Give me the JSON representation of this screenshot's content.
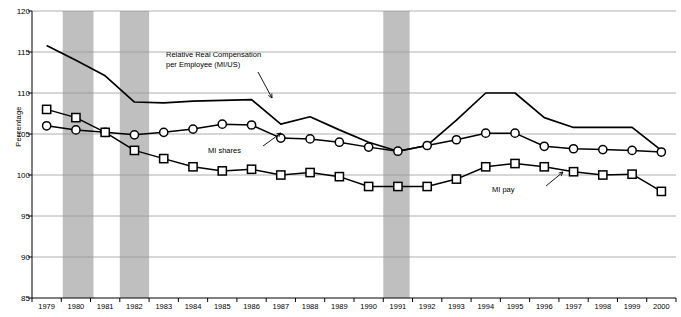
{
  "chart_data": {
    "type": "line",
    "title": "",
    "xlabel": "",
    "ylabel": "Percentage",
    "ylim": [
      85,
      120
    ],
    "ytick_step": 5,
    "yticks": [
      85,
      90,
      95,
      100,
      105,
      110,
      115,
      120
    ],
    "grid": true,
    "legend": "none-annotations-inline",
    "x": [
      1979,
      1980,
      1981,
      1982,
      1983,
      1984,
      1985,
      1986,
      1987,
      1988,
      1989,
      1990,
      1991,
      1992,
      1993,
      1994,
      1995,
      1996,
      1997,
      1998,
      1999,
      2000
    ],
    "categories": [
      "1979",
      "1980",
      "1981",
      "1982",
      "1983",
      "1984",
      "1985",
      "1986",
      "1987",
      "1988",
      "1989",
      "1990",
      "1991",
      "1992",
      "1993",
      "1994",
      "1995",
      "1996",
      "1997",
      "1998",
      "1999",
      "2000"
    ],
    "series": [
      {
        "name": "Relative Real Compensation per Employee (MI/US)",
        "marker": "none",
        "values": [
          115.8,
          114.0,
          112.1,
          108.9,
          108.8,
          109.0,
          109.1,
          109.2,
          106.2,
          107.1,
          105.5,
          104.0,
          102.9,
          103.6,
          106.7,
          110.0,
          110.0,
          107.0,
          105.8,
          105.8,
          105.8,
          103.0
        ]
      },
      {
        "name": "MI shares",
        "marker": "circle",
        "values": [
          106.0,
          105.5,
          105.2,
          104.9,
          105.2,
          105.6,
          106.2,
          106.1,
          104.5,
          104.4,
          104.0,
          103.4,
          102.9,
          103.6,
          104.3,
          105.1,
          105.1,
          103.5,
          103.2,
          103.1,
          103.0,
          102.8
        ]
      },
      {
        "name": "MI pay",
        "marker": "square",
        "values": [
          108.0,
          107.0,
          105.2,
          103.0,
          102.0,
          101.0,
          100.5,
          100.7,
          100.0,
          100.3,
          99.8,
          98.6,
          98.6,
          98.6,
          99.5,
          101.0,
          101.4,
          101.0,
          100.4,
          100.0,
          100.1,
          98.0
        ]
      }
    ],
    "annotations": [
      {
        "name": "compensation-label",
        "text": "Relative Real Compensation\nper Employee (MI/US)"
      },
      {
        "name": "mi-shares-label",
        "text": "MI shares"
      },
      {
        "name": "mi-pay-label",
        "text": "MI pay"
      }
    ],
    "shaded_bands": [
      {
        "name": "recession-band-1",
        "from": 1979.55,
        "to": 1980.6
      },
      {
        "name": "recession-band-2",
        "from": 1981.5,
        "to": 1982.5
      },
      {
        "name": "recession-band-3",
        "from": 1990.5,
        "to": 1991.4
      }
    ],
    "colors": {
      "band": "#bfbfbf",
      "line": "#000000",
      "grid": "#9a9a9a",
      "axis": "#000000",
      "background": "#ffffff"
    }
  }
}
